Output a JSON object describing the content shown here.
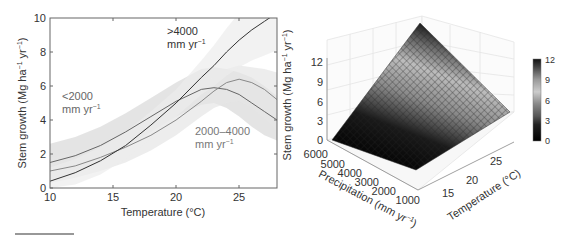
{
  "chart_data": [
    {
      "type": "line",
      "title": "",
      "xlabel": "Temperature (°C)",
      "ylabel": "Stem growth (Mg ha⁻¹ yr⁻¹)",
      "xlim": [
        10,
        28
      ],
      "ylim": [
        0,
        10
      ],
      "xticks": [
        10,
        15,
        20,
        25
      ],
      "yticks": [
        0,
        2,
        4,
        6,
        8,
        10
      ],
      "grid": false,
      "legend": "inline annotations",
      "x": [
        10,
        12,
        14,
        16,
        18,
        20,
        22,
        23,
        24,
        25,
        26,
        27,
        28
      ],
      "series": [
        {
          "name": "<2000 mm yr⁻¹",
          "annotation_line1": "<2000",
          "annotation_line2": "mm yr",
          "annotation_sup": "−1",
          "color": "#666666",
          "values": [
            1.5,
            1.9,
            2.5,
            3.3,
            4.2,
            5.1,
            5.8,
            5.9,
            5.8,
            5.5,
            5.0,
            4.5,
            4.0
          ],
          "ci_lower": [
            0.5,
            0.9,
            1.5,
            2.4,
            3.3,
            4.2,
            4.9,
            5.0,
            4.7,
            4.2,
            3.6,
            3.1,
            2.8
          ],
          "ci_upper": [
            2.6,
            3.0,
            3.6,
            4.4,
            5.3,
            6.2,
            7.0,
            7.1,
            7.0,
            6.8,
            6.5,
            6.0,
            5.4
          ]
        },
        {
          "name": "2000–4000 mm yr⁻¹",
          "annotation_line1": "2000–4000",
          "annotation_line2": "mm yr",
          "annotation_sup": "−1",
          "color": "#888888",
          "values": [
            1.0,
            1.3,
            1.8,
            2.4,
            3.1,
            4.0,
            5.1,
            5.7,
            6.2,
            6.4,
            6.2,
            5.8,
            5.2
          ],
          "ci_lower": [
            0.3,
            0.6,
            1.0,
            1.5,
            2.2,
            3.1,
            4.2,
            4.7,
            5.0,
            5.1,
            4.7,
            4.1,
            3.4
          ],
          "ci_upper": [
            1.8,
            2.1,
            2.6,
            3.3,
            4.0,
            4.9,
            6.0,
            6.6,
            7.0,
            7.2,
            7.1,
            7.0,
            6.8
          ]
        },
        {
          "name": ">4000 mm yr⁻¹",
          "annotation_line1": ">4000",
          "annotation_line2": "mm yr",
          "annotation_sup": "−1",
          "color": "#333333",
          "values": [
            0.4,
            0.9,
            1.6,
            2.5,
            3.7,
            5.0,
            6.5,
            7.2,
            8.0,
            8.7,
            9.3,
            9.8,
            10.3
          ],
          "ci_lower": [
            0.0,
            0.2,
            0.8,
            1.7,
            2.9,
            4.2,
            5.5,
            6.0,
            6.6,
            7.1,
            7.5,
            7.8,
            8.1
          ],
          "ci_upper": [
            1.2,
            1.7,
            2.4,
            3.3,
            4.5,
            5.8,
            7.5,
            8.4,
            9.4,
            10.3,
            11.0,
            11.7,
            12.3
          ]
        }
      ]
    },
    {
      "type": "surface3d",
      "title": "",
      "xlabel": "Precipitation (mm yr⁻¹)",
      "ylabel": "Temperature (°C)",
      "zlabel": "Stem growth (Mg ha⁻¹ yr⁻¹)",
      "xticks": [
        6000,
        5000,
        4000,
        3000,
        2000,
        1000
      ],
      "yticks": [
        15,
        20,
        25
      ],
      "zticks": [
        0,
        3,
        6,
        9,
        12
      ],
      "zlim": [
        0,
        12
      ],
      "colormap": "grayscale (black=0, light gray mid, black=12)",
      "colorbar_ticks": [
        0,
        3,
        6,
        9,
        12
      ],
      "corners": [
        {
          "precipitation": 6000,
          "temperature": 10,
          "growth": 0
        },
        {
          "precipitation": 1000,
          "temperature": 10,
          "growth": 0.5
        },
        {
          "precipitation": 1000,
          "temperature": 28,
          "growth": 5
        },
        {
          "precipitation": 6000,
          "temperature": 28,
          "growth": 12
        }
      ]
    }
  ],
  "left_chart": {
    "ylabel_main": "Stem growth (Mg ha",
    "ylabel_sup1": "−1",
    "ylabel_mid": " yr",
    "ylabel_sup2": "−1",
    "ylabel_end": ")",
    "xlabel": "Temperature (°C)",
    "yticks": [
      "0",
      "2",
      "4",
      "6",
      "8",
      "10"
    ],
    "xticks": [
      "10",
      "15",
      "20",
      "25"
    ],
    "ann_low_1": "<2000",
    "ann_low_2": "mm yr",
    "ann_mid_1": "2000–4000",
    "ann_mid_2": "mm yr",
    "ann_high_1": ">4000",
    "ann_high_2": "mm yr",
    "sup": "−1"
  },
  "right_chart": {
    "zlabel_main": "Stem growth (Mg ha",
    "zlabel_mid": " yr",
    "zlabel_end": ")",
    "sup": "−1",
    "zticks": [
      "0",
      "3",
      "6",
      "9",
      "12"
    ],
    "precip_ticks": [
      "6000",
      "5000",
      "4000",
      "3000",
      "2000",
      "1000"
    ],
    "temp_ticks": [
      "15",
      "20",
      "25"
    ],
    "precip_label_main": "Precipitation (mm yr",
    "precip_label_end": ")",
    "temp_label": "Temperature (°C)",
    "colorbar_ticks": [
      "12",
      "9",
      "6",
      "3",
      "0"
    ]
  }
}
